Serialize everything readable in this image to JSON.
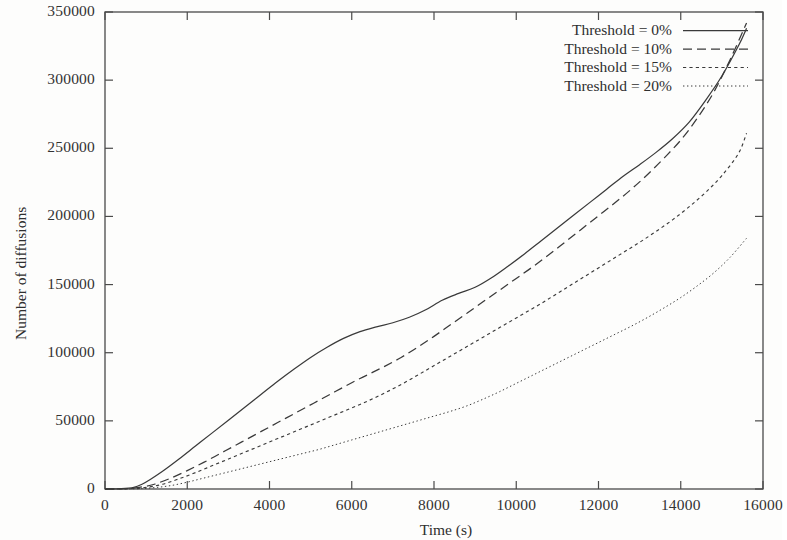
{
  "chart_data": {
    "type": "line",
    "title": "",
    "xlabel": "Time (s)",
    "ylabel": "Number of diffusions",
    "xlim": [
      0,
      16000
    ],
    "ylim": [
      0,
      350000
    ],
    "xticks": [
      0,
      2000,
      4000,
      6000,
      8000,
      10000,
      12000,
      14000,
      16000
    ],
    "yticks": [
      0,
      50000,
      100000,
      150000,
      200000,
      250000,
      300000,
      350000
    ],
    "xtick_labels": [
      "0",
      "2000",
      "4000",
      "6000",
      "8000",
      "10000",
      "12000",
      "14000",
      "16000"
    ],
    "ytick_labels": [
      "0",
      "50000",
      "100000",
      "150000",
      "200000",
      "250000",
      "300000",
      "350000"
    ],
    "grid": false,
    "legend_position": "top-right",
    "series": [
      {
        "name": "Threshold = 0%",
        "style": "solid",
        "x": [
          0,
          400,
          700,
          900,
          1100,
          1400,
          1800,
          2200,
          2600,
          3000,
          3400,
          3800,
          4200,
          4600,
          5000,
          5400,
          5800,
          6200,
          6600,
          7000,
          7400,
          7800,
          8200,
          8600,
          9000,
          9400,
          9800,
          10200,
          10600,
          11000,
          11400,
          11800,
          12200,
          12600,
          13000,
          13400,
          13800,
          14200,
          14600,
          15000,
          15400,
          15600
        ],
        "y": [
          0,
          200,
          1200,
          3500,
          7000,
          13000,
          22000,
          31500,
          41000,
          50500,
          60000,
          69500,
          79000,
          88000,
          96500,
          104000,
          110500,
          115500,
          119000,
          122000,
          126000,
          131500,
          138500,
          143500,
          148000,
          155000,
          163500,
          172500,
          182000,
          191500,
          201000,
          210500,
          220000,
          229500,
          238000,
          247000,
          257000,
          269000,
          285000,
          303000,
          325000,
          338000
        ]
      },
      {
        "name": "Threshold = 10%",
        "style": "dashed",
        "x": [
          0,
          500,
          900,
          1200,
          1600,
          2000,
          2400,
          2800,
          3200,
          3600,
          4000,
          4400,
          4800,
          5200,
          5600,
          6000,
          6400,
          6800,
          7200,
          7600,
          8000,
          8400,
          8800,
          9200,
          9600,
          10000,
          10400,
          10800,
          11200,
          11600,
          12000,
          12400,
          12800,
          13200,
          13600,
          14000,
          14400,
          14800,
          15200,
          15600
        ],
        "y": [
          0,
          200,
          1500,
          3500,
          8000,
          13500,
          19500,
          26000,
          32500,
          39000,
          45500,
          52000,
          58500,
          65000,
          71500,
          78000,
          84000,
          90000,
          96500,
          104000,
          112000,
          120500,
          129000,
          137500,
          146000,
          154500,
          163000,
          172000,
          181500,
          191000,
          200500,
          210000,
          220000,
          231000,
          243000,
          256000,
          272000,
          291000,
          315000,
          342000
        ]
      },
      {
        "name": "Threshold = 15%",
        "style": "dotted",
        "x": [
          0,
          600,
          1000,
          1400,
          1800,
          2200,
          2600,
          3000,
          3400,
          3800,
          4200,
          4600,
          5000,
          5400,
          5800,
          6200,
          6600,
          7000,
          7400,
          7800,
          8200,
          8600,
          9000,
          9400,
          9800,
          10200,
          10600,
          11000,
          11400,
          11800,
          12200,
          12600,
          13000,
          13400,
          13800,
          14200,
          14600,
          15000,
          15400,
          15600
        ],
        "y": [
          0,
          200,
          1200,
          3500,
          7500,
          12000,
          17000,
          22000,
          27000,
          32000,
          37000,
          42000,
          47000,
          52000,
          57000,
          62000,
          67500,
          73500,
          80000,
          87000,
          94000,
          101000,
          108000,
          115000,
          122000,
          129000,
          136000,
          143500,
          151000,
          158500,
          166000,
          173500,
          181000,
          189000,
          197500,
          207000,
          217500,
          230000,
          246000,
          261000
        ]
      },
      {
        "name": "Threshold = 20%",
        "style": "fine-dotted",
        "x": [
          0,
          800,
          1200,
          1600,
          2000,
          2400,
          2800,
          3200,
          3600,
          4000,
          4400,
          4800,
          5200,
          5600,
          6000,
          6400,
          6800,
          7200,
          7600,
          8000,
          8400,
          8800,
          9200,
          9600,
          10000,
          10400,
          10800,
          11200,
          11600,
          12000,
          12400,
          12800,
          13200,
          13600,
          14000,
          14400,
          14800,
          15200,
          15600
        ],
        "y": [
          0,
          200,
          1000,
          2500,
          5000,
          8000,
          11000,
          14000,
          17000,
          20000,
          23000,
          26000,
          29000,
          32500,
          36000,
          39500,
          43000,
          46500,
          50000,
          53500,
          57000,
          61000,
          66000,
          71500,
          77500,
          83500,
          89500,
          95500,
          101500,
          107500,
          113500,
          119500,
          126000,
          133000,
          140500,
          149000,
          158500,
          170000,
          184000
        ]
      }
    ]
  },
  "axes": {
    "xlabel": "Time (s)",
    "ylabel": "Number of diffusions"
  },
  "legend": {
    "entries": [
      {
        "label": "Threshold = 0%",
        "style": "solid"
      },
      {
        "label": "Threshold = 10%",
        "style": "dashed"
      },
      {
        "label": "Threshold = 15%",
        "style": "dotted"
      },
      {
        "label": "Threshold = 20%",
        "style": "fine-dotted"
      }
    ]
  },
  "colors": {
    "line": "#3a3a3a",
    "axis": "#4a4a4a",
    "text": "#2f2f2f",
    "background": "#fdfdfc"
  }
}
